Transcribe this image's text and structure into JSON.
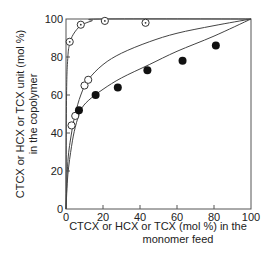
{
  "chart_data": {
    "type": "scatter",
    "title": "",
    "xlabel_line1": "CTCX or HCX or TCX (mol %) in the",
    "xlabel_line2": "monomer feed",
    "ylabel_line1": "CTCX or HCX or TCX unit (mol %)",
    "ylabel_line2": "in the copolymer",
    "xlim": [
      0,
      100
    ],
    "ylim": [
      0,
      100
    ],
    "xticks": [
      0,
      20,
      40,
      60,
      80,
      100
    ],
    "yticks": [
      0,
      20,
      40,
      60,
      80,
      100
    ],
    "grid": false,
    "series": [
      {
        "name": "dotted open circles",
        "marker": "circle-dot",
        "points": [
          [
            2,
            88
          ],
          [
            8,
            97
          ],
          [
            21,
            99
          ],
          [
            43,
            98
          ]
        ]
      },
      {
        "name": "open circles",
        "marker": "circle-open",
        "points": [
          [
            3,
            44
          ],
          [
            5,
            49
          ],
          [
            10,
            65
          ],
          [
            12,
            68
          ]
        ]
      },
      {
        "name": "filled circles",
        "marker": "circle-filled",
        "points": [
          [
            7,
            52
          ],
          [
            16,
            60
          ],
          [
            28,
            64
          ],
          [
            44,
            73
          ],
          [
            63,
            78
          ],
          [
            81,
            86
          ]
        ]
      }
    ],
    "curves": [
      {
        "name": "upper curve",
        "points": [
          [
            0,
            0
          ],
          [
            0.3,
            60
          ],
          [
            1,
            80
          ],
          [
            2,
            87
          ],
          [
            4,
            92
          ],
          [
            8,
            96.5
          ],
          [
            14,
            99
          ],
          [
            20,
            100
          ],
          [
            100,
            100
          ]
        ]
      },
      {
        "name": "middle curve",
        "points": [
          [
            0,
            0
          ],
          [
            1,
            25
          ],
          [
            3,
            40
          ],
          [
            5,
            50
          ],
          [
            8,
            60
          ],
          [
            12,
            68
          ],
          [
            20,
            76
          ],
          [
            30,
            82
          ],
          [
            45,
            88
          ],
          [
            60,
            92.5
          ],
          [
            80,
            96.5
          ],
          [
            100,
            100
          ]
        ]
      },
      {
        "name": "lower curve",
        "points": [
          [
            0,
            0
          ],
          [
            1,
            18
          ],
          [
            3,
            33
          ],
          [
            5,
            43
          ],
          [
            8,
            52
          ],
          [
            12,
            57
          ],
          [
            20,
            63
          ],
          [
            30,
            69
          ],
          [
            45,
            76
          ],
          [
            60,
            83
          ],
          [
            80,
            91
          ],
          [
            100,
            100
          ]
        ]
      }
    ]
  }
}
